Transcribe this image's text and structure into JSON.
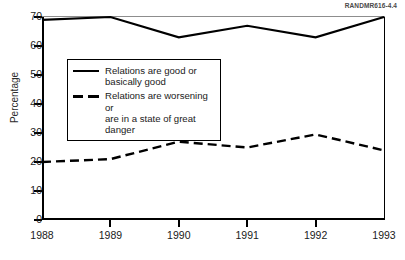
{
  "doc_id": "RANDMR616-4.4",
  "chart_data": {
    "type": "line",
    "title": "",
    "xlabel": "",
    "ylabel": "Percentage",
    "x": [
      1988,
      1989,
      1990,
      1991,
      1992,
      1993
    ],
    "xtick_labels": [
      "1988",
      "1989",
      "1990",
      "1991",
      "1992",
      "1993"
    ],
    "ytick_labels": [
      "0",
      "10",
      "20",
      "30",
      "40",
      "50",
      "60",
      "70"
    ],
    "yticks": [
      0,
      10,
      20,
      30,
      40,
      50,
      60,
      70
    ],
    "ylim": [
      0,
      70
    ],
    "xlim": [
      1988,
      1993
    ],
    "grid": false,
    "legend_position": "upper-left-inside",
    "series": [
      {
        "name": "Relations are good or basically good",
        "name_line1": "Relations are good or",
        "name_line2": "basically good",
        "style": "solid",
        "color": "#000000",
        "values": [
          69,
          70,
          63,
          67,
          63,
          70
        ]
      },
      {
        "name": "Relations are worsening or are in a state of great danger",
        "name_line1": "Relations are worsening or",
        "name_line2": "are in a state of great danger",
        "style": "dashed",
        "color": "#000000",
        "values": [
          20,
          21,
          27,
          25,
          29.5,
          24
        ]
      }
    ]
  }
}
